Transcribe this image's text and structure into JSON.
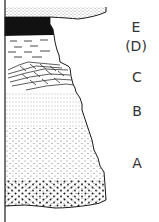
{
  "colors": {
    "ink": "#1a1a1a",
    "background": "#ffffff",
    "label": "#333333"
  },
  "layers": [
    {
      "id": "E",
      "label": "E",
      "pattern": "fine-dots",
      "description": "top fine sand layer"
    },
    {
      "id": "D-dark",
      "label": "",
      "pattern": "solid-black",
      "description": "dark layer (coal/organic)"
    },
    {
      "id": "D",
      "label": "(D)",
      "pattern": "dashes",
      "description": "shale/clay layer"
    },
    {
      "id": "C",
      "label": "C",
      "pattern": "cross-bedding",
      "description": "cross-bedded layer"
    },
    {
      "id": "B",
      "label": "B",
      "pattern": "fine-dotted-lines",
      "description": "fine-grained layer"
    },
    {
      "id": "A",
      "label": "A",
      "pattern": "coarse-dots",
      "description": "coarse sand layer, coarsening downward"
    }
  ]
}
